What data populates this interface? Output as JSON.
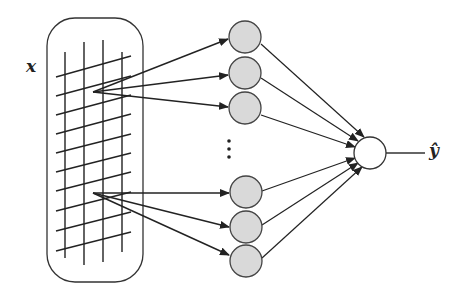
{
  "diagram": {
    "input_label": "x",
    "output_label": "ŷ",
    "ellipsis": "⋮",
    "hidden_nodes_top": 3,
    "hidden_nodes_bottom": 3,
    "colors": {
      "stroke": "#333333",
      "hidden_fill": "#d9d9d9",
      "output_fill": "#ffffff"
    }
  }
}
